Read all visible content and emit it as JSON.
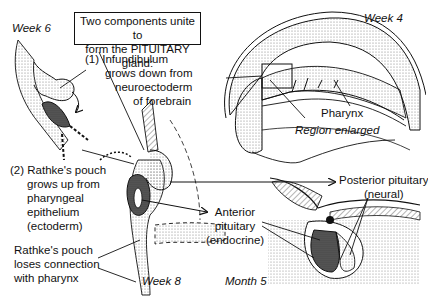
{
  "title_box": {
    "line1": "Two components unite to",
    "line2": "form the PITUITARY gland:"
  },
  "stages": {
    "week6": "Week 6",
    "week4": "Week 4",
    "week8": "Week 8",
    "month5": "Month 5"
  },
  "labels": {
    "component1": {
      "line1": "(1)  Infundibulum",
      "line2": "grows down from",
      "line3": "neuroectoderm",
      "line4": "of forebrain"
    },
    "component2": {
      "line1": "(2)  Rathke's pouch",
      "line2": "grows up from",
      "line3": "pharyngeal",
      "line4": "epithelium",
      "line5": "(ectoderm)"
    },
    "loses_connection": {
      "line1": "Rathke's pouch",
      "line2": "loses connection",
      "line3": "with pharynx"
    },
    "pharynx": "Pharynx",
    "region_enlarged": "Region enlarged",
    "posterior": {
      "line1": "Posterior pituitary",
      "line2": "(neural)"
    },
    "anterior": {
      "line1": "Anterior",
      "line2": "pituitary",
      "line3": "(endocrine)"
    }
  },
  "colors": {
    "ink": "#111111",
    "stipple": "#9a9a9a",
    "dense": "#333333",
    "background": "#ffffff"
  }
}
